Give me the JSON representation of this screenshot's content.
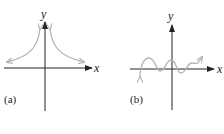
{
  "figure": {
    "panels": [
      {
        "id": "a",
        "caption": "(a)",
        "x_axis_label": "x",
        "y_axis_label": "y",
        "curve": "symmetric curve rising toward the y-axis on both sides (like 1/x^2), approaching the x-axis at the ends",
        "curve_color": "#b5b5b5"
      },
      {
        "id": "b",
        "caption": "(b)",
        "x_axis_label": "x",
        "y_axis_label": "y",
        "curve": "oscillating wave around the x-axis with increasing trend to the right",
        "curve_color": "#b5b5b5"
      }
    ],
    "colors": {
      "axis": "#222222",
      "curve": "#b5b5b5",
      "background": "#ffffff"
    }
  }
}
